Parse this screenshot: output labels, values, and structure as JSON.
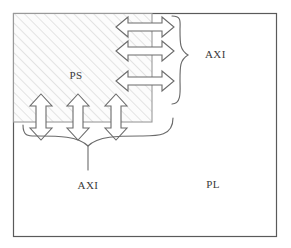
{
  "diagram": {
    "type": "block-diagram",
    "canvas": {
      "width": 291,
      "height": 248,
      "background": "#ffffff"
    },
    "colors": {
      "outline": "#5a5a5a",
      "arrow_outline": "#6b6b6b",
      "brace": "#6b6b6b",
      "hatch": "#cfcfcf",
      "hatch_fill": "#fbfbfb",
      "text": "#3a3a3a"
    },
    "regions": [
      {
        "id": "pl",
        "label": "PL",
        "label_x": 213,
        "label_y": 188,
        "rect": {
          "x": 13,
          "y": 13,
          "width": 264,
          "height": 224
        },
        "fill": "none",
        "hatched": false
      },
      {
        "id": "ps",
        "label": "PS",
        "label_x": 76,
        "label_y": 79,
        "rect": {
          "x": 13,
          "y": 13,
          "width": 139,
          "height": 109
        },
        "fill": "hatch",
        "hatched": true
      }
    ],
    "arrows": {
      "horizontal": {
        "count": 3,
        "orientation": "double-headed-horizontal",
        "items": [
          {
            "cx": 145,
            "cy": 27,
            "length": 58,
            "thickness": 16
          },
          {
            "cx": 145,
            "cy": 51,
            "length": 58,
            "thickness": 16
          },
          {
            "cx": 145,
            "cy": 81,
            "length": 58,
            "thickness": 16
          }
        ]
      },
      "vertical": {
        "count": 3,
        "orientation": "double-headed-vertical",
        "items": [
          {
            "cx": 41,
            "cy": 117,
            "length": 48,
            "thickness": 15
          },
          {
            "cx": 78,
            "cy": 117,
            "length": 48,
            "thickness": 15
          },
          {
            "cx": 116,
            "cy": 117,
            "length": 48,
            "thickness": 15
          }
        ]
      }
    },
    "braces": [
      {
        "id": "brace-right",
        "direction": "right",
        "label": "AXI",
        "label_x": 205,
        "label_y": 55,
        "span_start_y": 16,
        "span_end_y": 103,
        "x": 168,
        "tip_x": 188
      },
      {
        "id": "brace-bottom",
        "direction": "down",
        "label": "AXI",
        "label_x": 98,
        "label_y": 189,
        "span_start_x": 23,
        "span_end_x": 173,
        "y": 131,
        "tip_y": 170
      }
    ]
  }
}
